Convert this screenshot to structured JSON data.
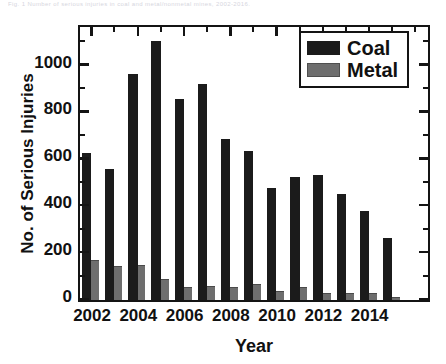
{
  "figure": {
    "top_caption": "Fig. 1  Number of serious injuries in coal and metal/nonmetal mines, 2002-2016."
  },
  "chart_data": {
    "type": "bar",
    "title": "",
    "xlabel": "Year",
    "ylabel": "No. of Serious Injuries",
    "categories": [
      "2002",
      "2003",
      "2004",
      "2005",
      "2006",
      "2007",
      "2008",
      "2009",
      "2010",
      "2011",
      "2012",
      "2013",
      "2014",
      "2015",
      "2016"
    ],
    "x_tick_labels": [
      "2002",
      "2004",
      "2006",
      "2008",
      "2010",
      "2012",
      "2014"
    ],
    "y_tick_labels": [
      "0",
      "200",
      "400",
      "600",
      "800",
      "1000"
    ],
    "y_tick_values": [
      0,
      200,
      400,
      600,
      800,
      1000
    ],
    "ylim": [
      0,
      1160
    ],
    "grid": false,
    "legend_position": "top-right",
    "series": [
      {
        "name": "Coal",
        "color": "#1b1b1b",
        "values": [
          627,
          558,
          962,
          1105,
          858,
          922,
          685,
          634,
          476,
          524,
          532,
          452,
          378,
          265,
          0
        ]
      },
      {
        "name": "Metal",
        "color": "#6e6e6e",
        "values": [
          172,
          145,
          148,
          90,
          55,
          60,
          55,
          70,
          38,
          55,
          30,
          30,
          30,
          10,
          0
        ]
      }
    ]
  },
  "legend": {
    "items": [
      {
        "label": "Coal",
        "color": "#1b1b1b"
      },
      {
        "label": "Metal",
        "color": "#6e6e6e"
      }
    ]
  }
}
